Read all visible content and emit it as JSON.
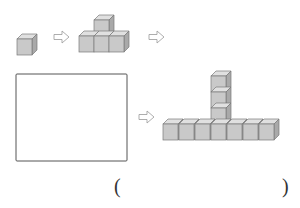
{
  "diagram": {
    "steps": [
      {
        "index": 1,
        "cubes": 1,
        "shape": "single cube"
      },
      {
        "index": 2,
        "cubes": 4,
        "shape": "row of 3 with 1 on top of middle"
      },
      {
        "index": 3,
        "cubes": null,
        "shape": "blank box (to be drawn)"
      },
      {
        "index": 4,
        "cubes": 10,
        "shape": "row of 7 with column of 3 on top of middle"
      }
    ],
    "arrow_glyph": "hollow-right-arrow",
    "answer_open_paren": "(",
    "answer_close_paren": ")",
    "colors": {
      "cube_front": "#c9c9c9",
      "cube_top": "#e0e0e0",
      "cube_side": "#a9a9a9",
      "cube_outline": "#7a7a7a",
      "box_outline": "#555555",
      "arrow_outline": "#999999"
    }
  }
}
